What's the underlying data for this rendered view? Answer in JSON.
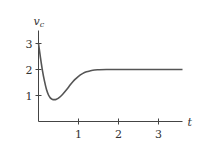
{
  "chart_data": {
    "type": "line",
    "title": "",
    "xlabel": "t",
    "ylabel": "v",
    "ylabel_subscript": "c",
    "xlim": [
      0,
      3.6
    ],
    "ylim": [
      0,
      3.5
    ],
    "x_ticks": [
      1,
      2,
      3
    ],
    "x_tick_labels": [
      "1",
      "2",
      "3"
    ],
    "y_ticks": [
      1,
      2,
      3
    ],
    "y_tick_labels": [
      "1",
      "2",
      "3"
    ],
    "grid": false,
    "legend": "none",
    "series": [
      {
        "name": "v_c(t)",
        "x": [
          0,
          0.05,
          0.1,
          0.15,
          0.2,
          0.25,
          0.3,
          0.35,
          0.4,
          0.45,
          0.5,
          0.6,
          0.7,
          0.8,
          0.9,
          1.0,
          1.1,
          1.2,
          1.3,
          1.4,
          1.5,
          1.7,
          2.0,
          2.5,
          3.0,
          3.6
        ],
        "values": [
          3.0,
          2.45,
          1.95,
          1.55,
          1.23,
          1.02,
          0.9,
          0.85,
          0.84,
          0.86,
          0.9,
          1.04,
          1.22,
          1.42,
          1.6,
          1.74,
          1.84,
          1.91,
          1.95,
          1.98,
          1.99,
          2.0,
          2.0,
          2.0,
          2.0,
          2.0
        ]
      }
    ]
  }
}
